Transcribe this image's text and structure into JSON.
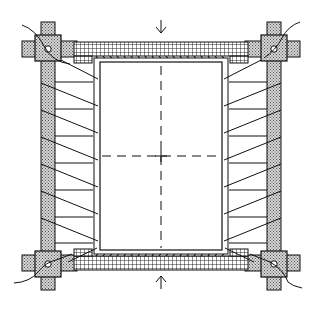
{
  "diagram": {
    "title": "",
    "colors": {
      "stroke": "#1a1a1a",
      "stipple_fill": "#c8c8c8",
      "background": "#ffffff"
    },
    "arrows": [
      {
        "id": "top-arrow",
        "direction": "down"
      },
      {
        "id": "bottom-arrow",
        "direction": "up"
      }
    ],
    "corner_clamps": [
      "top-left",
      "top-right",
      "bottom-left",
      "bottom-right"
    ],
    "tension_lines_per_side": 7,
    "center_crosshair": true
  }
}
